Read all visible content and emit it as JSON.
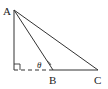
{
  "diagram": {
    "type": "geometry-triangle",
    "points": {
      "A": {
        "label": "A",
        "x": 14,
        "y": 10
      },
      "D": {
        "label": "",
        "x": 14,
        "y": 70
      },
      "B": {
        "label": "B",
        "x": 53,
        "y": 70
      },
      "C": {
        "label": "C",
        "x": 98,
        "y": 70
      }
    },
    "angle_label": "θ",
    "right_angle_at": "D",
    "segments": [
      {
        "from": "A",
        "to": "D",
        "style": "solid"
      },
      {
        "from": "D",
        "to": "B",
        "style": "dashed"
      },
      {
        "from": "B",
        "to": "C",
        "style": "solid"
      },
      {
        "from": "A",
        "to": "B",
        "style": "solid"
      },
      {
        "from": "A",
        "to": "C",
        "style": "solid"
      }
    ],
    "stroke_color": "#333333"
  }
}
